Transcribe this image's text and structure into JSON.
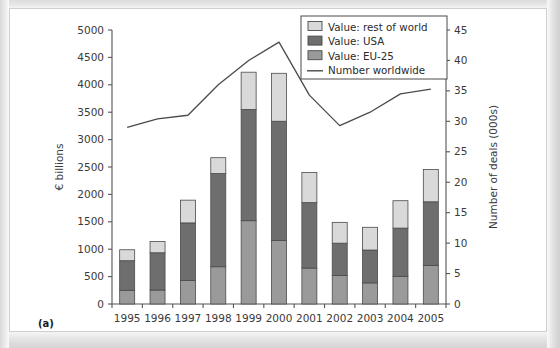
{
  "figure": {
    "panel_label": "(a)",
    "left_axis_title": "€ billions",
    "right_axis_title": "Number of deals (000s)"
  },
  "legend": {
    "items": [
      {
        "label": "Value: rest of world",
        "type": "swatch",
        "color": "#d9d9d9",
        "key": "rest_of_world"
      },
      {
        "label": "Value: USA",
        "type": "swatch",
        "color": "#6e6e6e",
        "key": "usa"
      },
      {
        "label": "Value: EU-25",
        "type": "swatch",
        "color": "#9a9a9a",
        "key": "eu25"
      },
      {
        "label": "Number worldwide",
        "type": "line",
        "color": "#4a4a4a",
        "key": "number_worldwide"
      }
    ]
  },
  "chart_data": {
    "type": "bar",
    "title": "",
    "subtitle": "",
    "xlabel": "",
    "ylabel": "€ billions",
    "y2label": "Number of deals (000s)",
    "ylim": [
      0,
      5000
    ],
    "y2lim": [
      0,
      45
    ],
    "yticks": [
      0,
      500,
      1000,
      1500,
      2000,
      2500,
      3000,
      3500,
      4000,
      4500,
      5000
    ],
    "y2ticks": [
      0,
      5,
      10,
      15,
      20,
      25,
      30,
      35,
      40,
      45
    ],
    "ytick_labels": [
      "0",
      "500",
      "1000",
      "1500",
      "2000",
      "2500",
      "3000",
      "3500",
      "4000",
      "4500",
      "5000"
    ],
    "y2tick_labels": [
      "0",
      "5",
      "10",
      "15",
      "20",
      "25",
      "30",
      "35",
      "40",
      "45"
    ],
    "grid": false,
    "legend_position": "top-right",
    "stacked": true,
    "categories": [
      "1995",
      "1996",
      "1997",
      "1998",
      "1999",
      "2000",
      "2001",
      "2002",
      "2003",
      "2004",
      "2005"
    ],
    "series": [
      {
        "name": "Value: EU-25",
        "axis": "left",
        "kind": "bar",
        "color": "#9a9a9a",
        "values": [
          250,
          255,
          430,
          680,
          1520,
          1160,
          655,
          520,
          385,
          505,
          705
        ]
      },
      {
        "name": "Value: USA",
        "axis": "left",
        "kind": "bar",
        "color": "#6e6e6e",
        "values": [
          540,
          680,
          1050,
          1700,
          2030,
          2175,
          1195,
          590,
          600,
          880,
          1160
        ]
      },
      {
        "name": "Value: rest of world",
        "axis": "left",
        "kind": "bar",
        "color": "#d9d9d9",
        "values": [
          200,
          205,
          415,
          290,
          680,
          875,
          550,
          380,
          415,
          500,
          590
        ]
      },
      {
        "name": "Number worldwide",
        "axis": "right",
        "kind": "line",
        "color": "#4a4a4a",
        "values": [
          29.0,
          30.4,
          31.0,
          36.0,
          40.0,
          43.0,
          34.3,
          29.3,
          31.5,
          34.5,
          35.3
        ]
      }
    ],
    "totals": [
      990,
      1140,
      1895,
      2670,
      4230,
      4210,
      2400,
      1490,
      1400,
      1885,
      2455
    ]
  }
}
